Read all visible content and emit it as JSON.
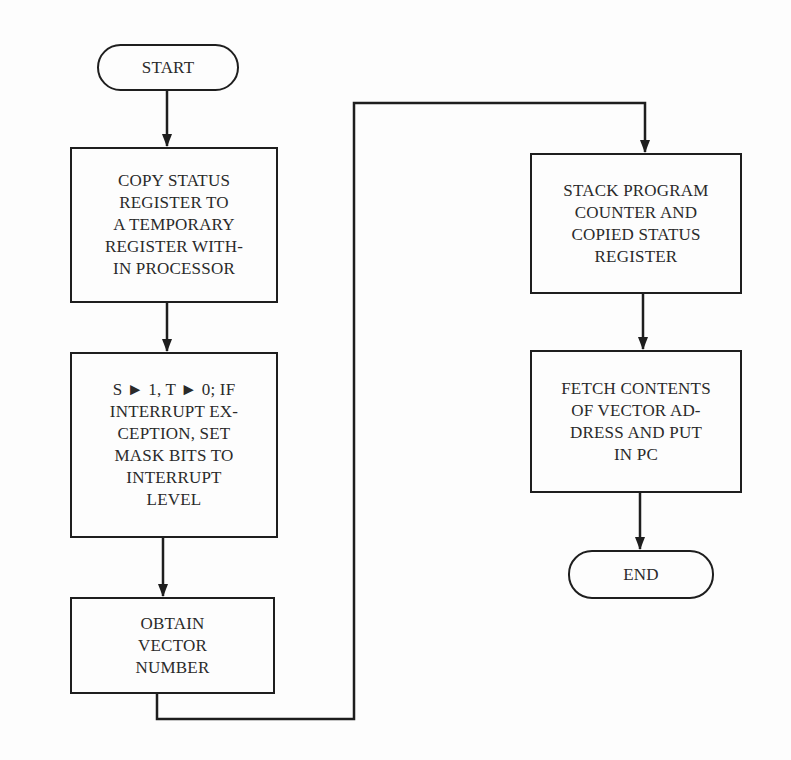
{
  "diagram": {
    "type": "flowchart",
    "nodes": [
      {
        "id": "start",
        "shape": "terminal",
        "label": "START"
      },
      {
        "id": "copy_status",
        "shape": "process",
        "label": "COPY STATUS\nREGISTER TO\nA TEMPORARY\nREGISTER WITH-\nIN PROCESSOR"
      },
      {
        "id": "set_bits",
        "shape": "process",
        "label": "S ► 1, T ► 0; IF\nINTERRUPT EX-\nCEPTION, SET\nMASK BITS TO\nINTERRUPT\nLEVEL"
      },
      {
        "id": "obtain_vector",
        "shape": "process",
        "label": "OBTAIN\nVECTOR\nNUMBER"
      },
      {
        "id": "stack_pc",
        "shape": "process",
        "label": "STACK PROGRAM\nCOUNTER AND\nCOPIED STATUS\nREGISTER"
      },
      {
        "id": "fetch_vector",
        "shape": "process",
        "label": "FETCH CONTENTS\nOF VECTOR AD-\nDRESS AND PUT\nIN PC"
      },
      {
        "id": "end",
        "shape": "terminal",
        "label": "END"
      }
    ],
    "edges": [
      {
        "from": "start",
        "to": "copy_status"
      },
      {
        "from": "copy_status",
        "to": "set_bits"
      },
      {
        "from": "set_bits",
        "to": "obtain_vector"
      },
      {
        "from": "obtain_vector",
        "to": "stack_pc"
      },
      {
        "from": "stack_pc",
        "to": "fetch_vector"
      },
      {
        "from": "fetch_vector",
        "to": "end"
      }
    ],
    "colors": {
      "line": "#1e1e1e",
      "background": "#fdfdfd",
      "text": "#2a2a2a"
    }
  }
}
